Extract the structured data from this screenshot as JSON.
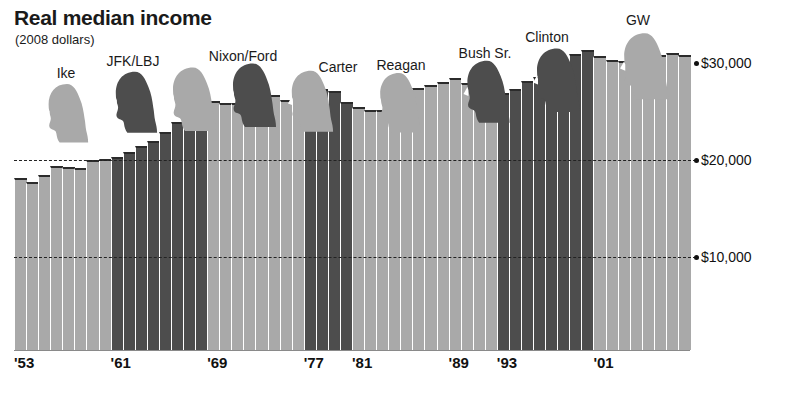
{
  "chart_data": {
    "type": "bar",
    "title": "Real median income",
    "subtitle": "(2008 dollars)",
    "xlabel": "",
    "ylabel": "",
    "ylim": [
      0,
      34000
    ],
    "grid": true,
    "legend_position": "none",
    "y_ticks": [
      {
        "label": "$10,000",
        "value": 10000
      },
      {
        "label": "$20,000",
        "value": 20000
      },
      {
        "label": "$30,000",
        "value": 30000
      }
    ],
    "x_ticks": [
      {
        "label": "'53",
        "year": 1953
      },
      {
        "label": "'61",
        "year": 1961
      },
      {
        "label": "'69",
        "year": 1969
      },
      {
        "label": "'77",
        "year": 1977
      },
      {
        "label": "'81",
        "year": 1981
      },
      {
        "label": "'89",
        "year": 1989
      },
      {
        "label": "'93",
        "year": 1993
      },
      {
        "label": "'01",
        "year": 2001
      }
    ],
    "colors": {
      "republican": "#a9a9a9",
      "democrat": "#4d4d4d",
      "outline": "#2b2b2b",
      "gridline": "#222222",
      "text": "#111111"
    },
    "categories": [
      1953,
      1954,
      1955,
      1956,
      1957,
      1958,
      1959,
      1960,
      1961,
      1962,
      1963,
      1964,
      1965,
      1966,
      1967,
      1968,
      1969,
      1970,
      1971,
      1972,
      1973,
      1974,
      1975,
      1976,
      1977,
      1978,
      1979,
      1980,
      1981,
      1982,
      1983,
      1984,
      1985,
      1986,
      1987,
      1988,
      1989,
      1990,
      1991,
      1992,
      1993,
      1994,
      1995,
      1996,
      1997,
      1998,
      1999,
      2000,
      2001,
      2002,
      2003,
      2004,
      2005,
      2006,
      2007,
      2008
    ],
    "values": [
      18100,
      17700,
      18500,
      19400,
      19300,
      19200,
      20000,
      20100,
      20300,
      20800,
      21400,
      22000,
      22900,
      23900,
      24300,
      25400,
      26100,
      25900,
      25900,
      27000,
      27600,
      26700,
      26200,
      26600,
      26900,
      27300,
      27100,
      26000,
      25500,
      25200,
      25200,
      25900,
      26400,
      27400,
      27700,
      28000,
      28500,
      27900,
      27200,
      27000,
      26900,
      27300,
      28100,
      28600,
      29400,
      30300,
      30900,
      31300,
      30700,
      30300,
      30200,
      30100,
      30400,
      30800,
      31000,
      30800
    ],
    "bar_parties": [
      "rep",
      "rep",
      "rep",
      "rep",
      "rep",
      "rep",
      "rep",
      "rep",
      "dem",
      "dem",
      "dem",
      "dem",
      "dem",
      "dem",
      "dem",
      "dem",
      "rep",
      "rep",
      "rep",
      "rep",
      "rep",
      "rep",
      "rep",
      "rep",
      "dem",
      "dem",
      "dem",
      "dem",
      "rep",
      "rep",
      "rep",
      "rep",
      "rep",
      "rep",
      "rep",
      "rep",
      "rep",
      "rep",
      "rep",
      "rep",
      "dem",
      "dem",
      "dem",
      "dem",
      "dem",
      "dem",
      "dem",
      "dem",
      "rep",
      "rep",
      "rep",
      "rep",
      "rep",
      "rep",
      "rep",
      "rep"
    ],
    "presidents": [
      {
        "label": "Ike",
        "party": "rep",
        "start_year": 1953,
        "end_year": 1960,
        "label_x": 66,
        "label_y": 65,
        "head_x": 67,
        "head_y": 82,
        "head_w": 46,
        "head_h": 62
      },
      {
        "label": "JFK/LBJ",
        "party": "dem",
        "start_year": 1961,
        "end_year": 1968,
        "label_x": 133,
        "label_y": 53,
        "head_x": 135,
        "head_y": 70,
        "head_w": 48,
        "head_h": 64
      },
      {
        "label": "Nixon/Ford",
        "party": "rep",
        "start_year": 1969,
        "end_year": 1976,
        "label_x": 243,
        "label_y": 48,
        "head_x": 193,
        "head_y": 66,
        "head_w": 50,
        "head_h": 66
      },
      {
        "label": "Carter",
        "party": "dem",
        "start_year": 1977,
        "end_year": 1980,
        "label_x": 338,
        "label_y": 59,
        "head_x": 253,
        "head_y": 62,
        "head_w": 50,
        "head_h": 66
      },
      {
        "label": "Reagan",
        "party": "rep",
        "start_year": 1981,
        "end_year": 1988,
        "label_x": 401,
        "label_y": 57,
        "head_x": 311,
        "head_y": 69,
        "head_w": 48,
        "head_h": 64
      },
      {
        "label": "Bush Sr.",
        "party": "rep",
        "start_year": 1989,
        "end_year": 1992,
        "label_x": 485,
        "label_y": 45,
        "head_x": 399,
        "head_y": 71,
        "head_w": 47,
        "head_h": 63
      },
      {
        "label": "Clinton",
        "party": "dem",
        "start_year": 1993,
        "end_year": 2000,
        "label_x": 547,
        "label_y": 29,
        "head_x": 487,
        "head_y": 59,
        "head_w": 49,
        "head_h": 65
      },
      {
        "label": "GW",
        "party": "rep",
        "start_year": 2001,
        "end_year": 2008,
        "label_x": 638,
        "label_y": 12,
        "head_x": 645,
        "head_y": 32,
        "head_w": 52,
        "head_h": 68
      }
    ],
    "extra_heads": [
      {
        "party": "dem",
        "head_x": 557,
        "head_y": 47,
        "head_w": 50,
        "head_h": 66
      }
    ]
  }
}
